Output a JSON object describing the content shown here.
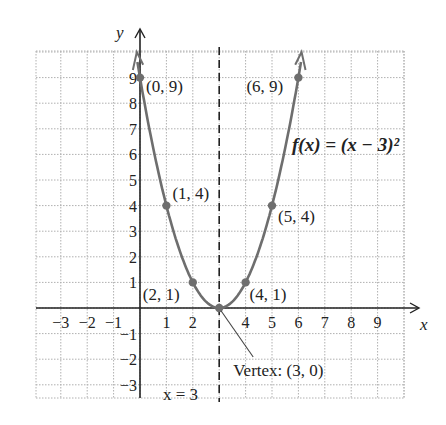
{
  "chart_data": {
    "type": "line",
    "title": "",
    "function_label": "f(x) = (x − 3)²",
    "xlabel": "x",
    "ylabel": "y",
    "xlim": [
      -4,
      10.5
    ],
    "ylim": [
      -3.5,
      10
    ],
    "grid": true,
    "x_ticks": [
      -3,
      -2,
      -1,
      1,
      2,
      4,
      5,
      6,
      7,
      8,
      9
    ],
    "y_ticks": [
      -3,
      -2,
      -1,
      1,
      2,
      3,
      4,
      5,
      6,
      7,
      8,
      9
    ],
    "series": [
      {
        "name": "f(x) = (x − 3)²",
        "x": [
          0,
          1,
          2,
          3,
          4,
          5,
          6
        ],
        "y": [
          9,
          4,
          1,
          0,
          1,
          4,
          9
        ]
      }
    ],
    "points": [
      {
        "x": 0,
        "y": 9,
        "label": "(0, 9)"
      },
      {
        "x": 1,
        "y": 4,
        "label": "(1, 4)"
      },
      {
        "x": 2,
        "y": 1,
        "label": "(2, 1)"
      },
      {
        "x": 3,
        "y": 0,
        "label": "Vertex: (3, 0)"
      },
      {
        "x": 4,
        "y": 1,
        "label": "(4, 1)"
      },
      {
        "x": 5,
        "y": 4,
        "label": "(5, 4)"
      },
      {
        "x": 6,
        "y": 9,
        "label": "(6, 9)"
      }
    ],
    "axis_of_symmetry": {
      "x": 3,
      "label": "x = 3"
    },
    "annotations": [
      "(0, 9)",
      "(1, 4)",
      "(2, 1)",
      "(4, 1)",
      "(5, 4)",
      "(6, 9)",
      "Vertex: (3, 0)",
      "x = 3",
      "f(x) = (x − 3)²"
    ],
    "colors": {
      "curve": "#6e6e6e",
      "axis": "#222222",
      "grid": "#b0b0b0"
    }
  }
}
